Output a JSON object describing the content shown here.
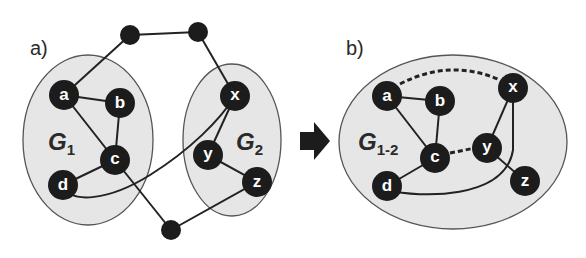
{
  "figure": {
    "panels": [
      {
        "id": "a",
        "label": "a)",
        "graphs": [
          {
            "name": "G",
            "subscript": "1",
            "nodes": [
              "a",
              "b",
              "c",
              "d"
            ]
          },
          {
            "name": "G",
            "subscript": "2",
            "nodes": [
              "x",
              "y",
              "z"
            ]
          }
        ],
        "external_nodes": 3,
        "edges": [
          [
            "a",
            "b"
          ],
          [
            "a",
            "c"
          ],
          [
            "b",
            "c"
          ],
          [
            "c",
            "d"
          ],
          [
            "d",
            "x"
          ],
          [
            "x",
            "y"
          ],
          [
            "y",
            "z"
          ],
          [
            "a",
            "ext1"
          ],
          [
            "ext1",
            "ext2"
          ],
          [
            "ext2",
            "x"
          ],
          [
            "c",
            "ext3"
          ],
          [
            "ext3",
            "z"
          ]
        ]
      },
      {
        "id": "b",
        "label": "b)",
        "graphs": [
          {
            "name": "G",
            "subscript": "1-2",
            "nodes": [
              "a",
              "b",
              "c",
              "d",
              "x",
              "y",
              "z"
            ]
          }
        ],
        "edges": [
          [
            "a",
            "b"
          ],
          [
            "a",
            "c"
          ],
          [
            "b",
            "c"
          ],
          [
            "c",
            "d"
          ],
          [
            "d",
            "x"
          ],
          [
            "x",
            "y"
          ],
          [
            "y",
            "z"
          ]
        ],
        "dashed_edges": [
          [
            "a",
            "x"
          ],
          [
            "c",
            "y"
          ]
        ]
      }
    ],
    "arrow": "right-arrow",
    "node_labels": {
      "a": "a",
      "b": "b",
      "c": "c",
      "d": "d",
      "x": "x",
      "y": "y",
      "z": "z"
    },
    "colors": {
      "node": "#1c1c1c",
      "region": "#e6e6e6",
      "edge": "#222222"
    }
  }
}
